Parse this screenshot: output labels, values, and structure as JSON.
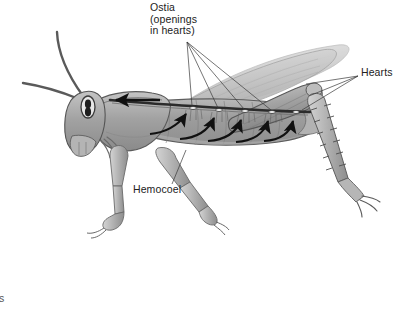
{
  "figure": {
    "kind": "biology-illustration",
    "topic": "open circulatory system",
    "style": "grayscale halftone textbook drawing",
    "background_color": "#ffffff",
    "body_color": "#a0a0a0",
    "body_light": "#c9c9c9",
    "body_dark": "#6e6e6e",
    "outline_color": "#4a4a4a",
    "wing_color": "#bdbdbd",
    "arrow_color": "#111111",
    "leader_color": "#3a3a3a",
    "label_color": "#222222"
  },
  "labels": {
    "ostia": "Ostia\n(openings\nin hearts)",
    "hearts": "Hearts",
    "hemocoel": "Hemocoel",
    "clipped_fragment": "ts"
  },
  "annotations": {
    "ostia_leader_origin": {
      "x": 187,
      "y": 42
    },
    "ostia_targets": [
      {
        "x": 193,
        "y": 110
      },
      {
        "x": 219,
        "y": 112
      },
      {
        "x": 245,
        "y": 113
      },
      {
        "x": 272,
        "y": 113
      },
      {
        "x": 296,
        "y": 112
      }
    ],
    "hearts_leader_origin": {
      "x": 358,
      "y": 76
    },
    "hearts_targets": [
      {
        "x": 309,
        "y": 86
      },
      {
        "x": 311,
        "y": 97
      },
      {
        "x": 305,
        "y": 110
      }
    ],
    "hemocoel_leader": {
      "from": {
        "x": 172,
        "y": 184
      },
      "to": {
        "x": 186,
        "y": 151
      }
    },
    "flow_arrows_count": 5,
    "aorta_arrow": {
      "from": {
        "x": 160,
        "y": 100
      },
      "to": {
        "x": 113,
        "y": 100
      },
      "direction": "anterior"
    }
  }
}
